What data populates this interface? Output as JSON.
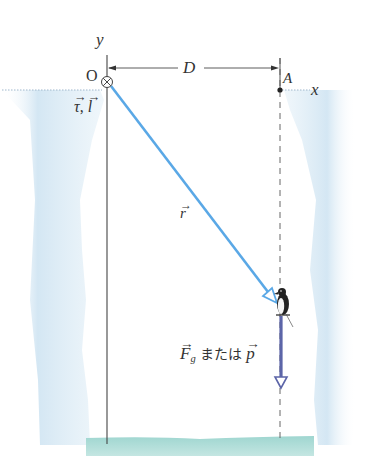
{
  "diagram": {
    "type": "physics-torque-angular-momentum",
    "axes": {
      "y_label": "y",
      "x_label": "x",
      "origin_label": "O"
    },
    "distance_label": "D",
    "point_A_label": "A",
    "origin_vectors_label": {
      "tau": "τ",
      "separator": ",",
      "l": "l"
    },
    "position_vector_label": "r",
    "force_label": {
      "F": "F",
      "sub": "g",
      "middle": "または",
      "p": "p"
    },
    "colors": {
      "axis": "#444444",
      "position_vector": "#5aa8e6",
      "force_vector": "#5c65a8",
      "ice": "#cfe4f2",
      "water": "#9fd6d0",
      "dashed_line": "#666666"
    }
  }
}
